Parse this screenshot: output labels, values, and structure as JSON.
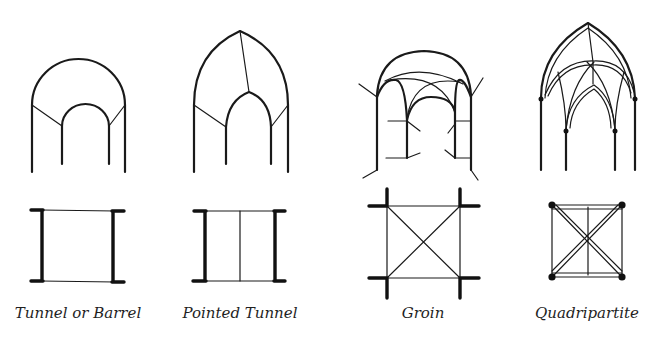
{
  "figure": {
    "type": "architectural vault types",
    "line_color": "#1a1a1a",
    "background": "#ffffff",
    "vaults": [
      {
        "id": "tunnel",
        "label": "Tunnel or Barrel",
        "caption_x": 78
      },
      {
        "id": "pointed",
        "label": "Pointed Tunnel",
        "caption_x": 240
      },
      {
        "id": "groin",
        "label": "Groin",
        "caption_x": 423
      },
      {
        "id": "quadripartite",
        "label": "Quadripartite",
        "caption_x": 587
      }
    ]
  }
}
